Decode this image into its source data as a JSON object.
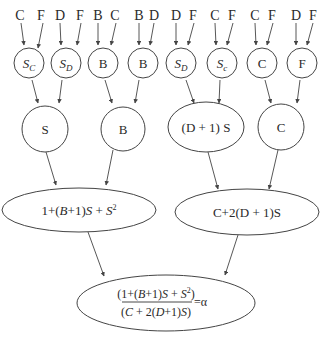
{
  "diagram": {
    "type": "tree-flow",
    "colors": {
      "stroke": "#444444",
      "text": "#2a2a2a",
      "background": "#ffffff"
    },
    "inputs": [
      {
        "label": "C",
        "x": 20
      },
      {
        "label": "F",
        "x": 41
      },
      {
        "label": "D",
        "x": 60
      },
      {
        "label": "F",
        "x": 80
      },
      {
        "label": "B",
        "x": 98
      },
      {
        "label": "C",
        "x": 115
      },
      {
        "label": "B",
        "x": 139
      },
      {
        "label": "D",
        "x": 154
      },
      {
        "label": "D",
        "x": 176
      },
      {
        "label": "F",
        "x": 193
      },
      {
        "label": "C",
        "x": 215
      },
      {
        "label": "F",
        "x": 232
      },
      {
        "label": "C",
        "x": 255
      },
      {
        "label": "F",
        "x": 272
      },
      {
        "label": "D",
        "x": 296
      },
      {
        "label": "F",
        "x": 313
      }
    ],
    "level1": [
      {
        "main": "S",
        "sub": "C",
        "italic": true
      },
      {
        "main": "S",
        "sub": "D",
        "italic": true
      },
      {
        "main": "B",
        "sub": "",
        "italic": false
      },
      {
        "main": "B",
        "sub": "",
        "italic": false
      },
      {
        "main": "S",
        "sub": "D",
        "italic": true
      },
      {
        "main": "S",
        "sub": "c",
        "italic": true
      },
      {
        "main": "C",
        "sub": "",
        "italic": false
      },
      {
        "main": "F",
        "sub": "",
        "italic": false
      }
    ],
    "level2": [
      {
        "label": "S"
      },
      {
        "label": "B"
      },
      {
        "label": "(D + 1) S"
      },
      {
        "label": "C"
      }
    ],
    "level3": [
      {
        "label_parts": [
          "1+(",
          "B",
          "+1)",
          "S",
          " + ",
          "S",
          "2"
        ]
      },
      {
        "label": "C+2(D + 1)S"
      }
    ],
    "result": {
      "numerator": [
        "(1+(",
        "B",
        "+1)",
        "S",
        " + ",
        "S",
        "2",
        ")"
      ],
      "denominator": [
        "(",
        "C",
        " + 2(",
        "D",
        "+1)",
        "S",
        ")"
      ],
      "equals": "=α"
    }
  }
}
